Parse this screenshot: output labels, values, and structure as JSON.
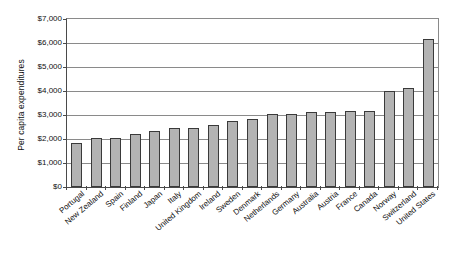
{
  "chart": {
    "type": "bar",
    "title": "",
    "ylabel": "Per capita expenditures",
    "xlabel": "",
    "currency_prefix": "$"
  },
  "axis": {
    "y_ticks": [
      "$0",
      "$1,000",
      "$2,000",
      "$3,000",
      "$4,000",
      "$5,000",
      "$6,000",
      "$7,000"
    ],
    "y_tick_values": [
      0,
      1000,
      2000,
      3000,
      4000,
      5000,
      6000,
      7000
    ]
  },
  "chart_data": {
    "type": "bar",
    "title": "",
    "xlabel": "",
    "ylabel": "Per capita expenditures",
    "ylim": [
      0,
      7000
    ],
    "ytick_step": 1000,
    "grid": true,
    "legend": false,
    "categories": [
      "Portugal",
      "New Zealand",
      "Spain",
      "Finland",
      "Japan",
      "Italy",
      "United Kingdom",
      "Ireland",
      "Sweden",
      "Denmark",
      "Netherlands",
      "Germany",
      "Australia",
      "Austria",
      "France",
      "Canada",
      "Norway",
      "Switzerland",
      "United States"
    ],
    "values": [
      1830,
      2050,
      2050,
      2200,
      2340,
      2440,
      2460,
      2600,
      2760,
      2840,
      3060,
      3060,
      3120,
      3120,
      3160,
      3170,
      3990,
      4130,
      6150
    ],
    "bar_color": "#b3b3b3",
    "bar_edge_color": "#3a3a3a"
  }
}
